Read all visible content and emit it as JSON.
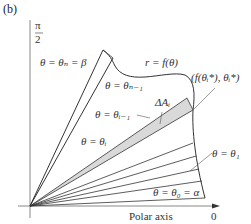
{
  "figure": {
    "panel_label": "(b)",
    "vertical_axis_label_num": "π",
    "vertical_axis_label_den": "2",
    "horizontal_axis_label": "Polar axis",
    "horizontal_axis_zero": "0",
    "curve_label": "r = f(θ)",
    "point_label": "(f(θᵢ*), θᵢ*)",
    "area_label": "ΔAᵢ",
    "ray_labels": {
      "theta_n": "θ = θₙ = β",
      "theta_n_minus_1": "θ = θₙ₋₁",
      "theta_i_minus_1": "θ = θᵢ₋₁",
      "theta_i": "θ = θᵢ",
      "theta_1": "θ = θ₁",
      "theta_0": "θ = θ₀ = α"
    },
    "colors": {
      "line": "#333333",
      "axis": "#888888",
      "shade": "#d9d9d9"
    }
  }
}
